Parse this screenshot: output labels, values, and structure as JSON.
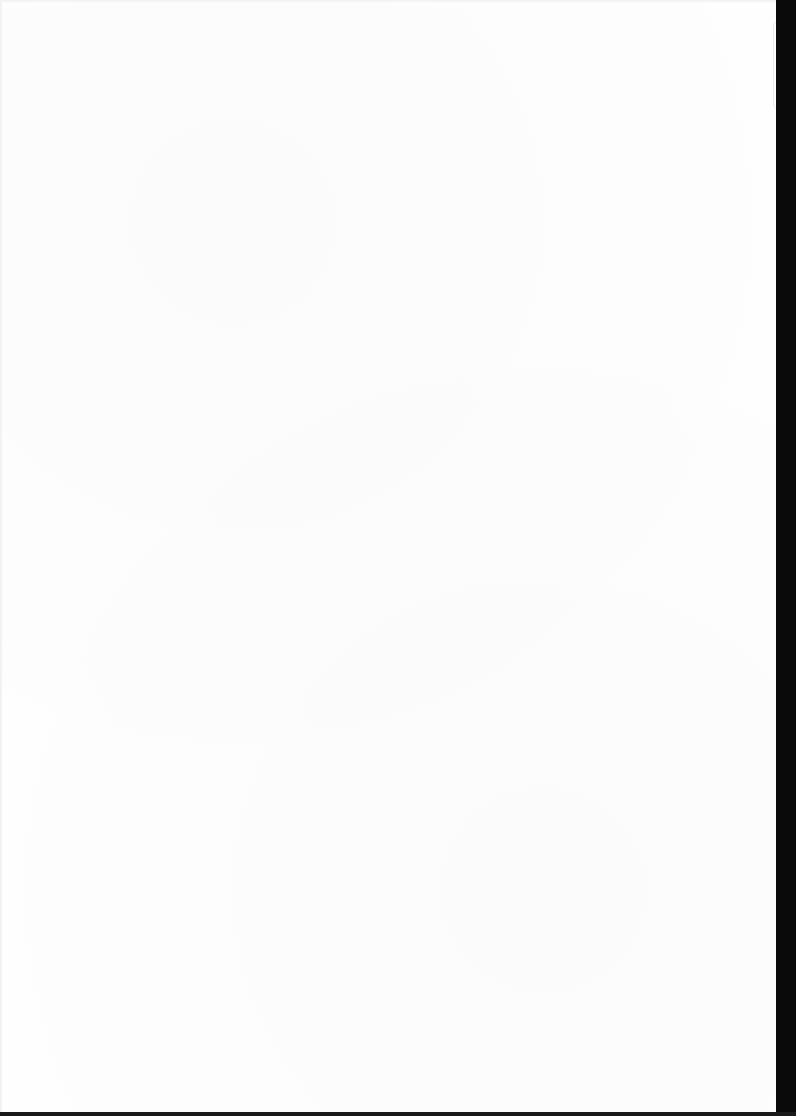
{
  "document": {
    "type": "scanned-page",
    "content": "",
    "colors": {
      "paper": "#fefefe",
      "scanner_edge": "#0a0a0a"
    }
  }
}
